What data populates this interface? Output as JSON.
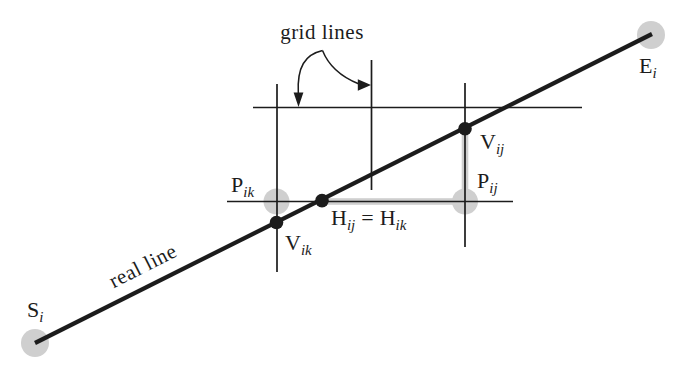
{
  "figure": {
    "colors": {
      "ink": "#1c1c1c",
      "highlight": "#cfcfcf",
      "background": "#ffffff"
    },
    "callout": {
      "text": "grid lines"
    },
    "line_annotation": {
      "text": "real line"
    },
    "points": {
      "start": {
        "main": "S",
        "sub": "i"
      },
      "end": {
        "main": "E",
        "sub": "i"
      },
      "p_ik": {
        "main": "P",
        "sub": "ik"
      },
      "p_ij": {
        "main": "P",
        "sub": "ij"
      },
      "v_ik": {
        "main": "V",
        "sub": "ik"
      },
      "v_ij": {
        "main": "V",
        "sub": "ij"
      }
    },
    "h_equation": {
      "h1": "H",
      "sub1": "ij",
      "eq": "=",
      "h2": "H",
      "sub2": "ik"
    }
  }
}
